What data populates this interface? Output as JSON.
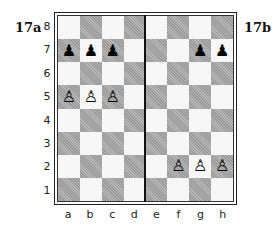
{
  "diagram": {
    "left_label": "17a",
    "right_label": "17b",
    "ranks": [
      "8",
      "7",
      "6",
      "5",
      "4",
      "3",
      "2",
      "1"
    ],
    "files": [
      "a",
      "b",
      "c",
      "d",
      "e",
      "f",
      "g",
      "h"
    ],
    "divider_between": [
      "d",
      "e"
    ],
    "pieces": {
      "a7": "♟",
      "b7": "♟",
      "c7": "♟",
      "g7": "♟",
      "h7": "♟",
      "a5": "♙",
      "b5": "♙",
      "c5": "♙",
      "f2": "♙",
      "g2": "♙",
      "h2": "♙"
    },
    "piece_names": {
      "a7": "black-pawn",
      "b7": "black-pawn",
      "c7": "black-pawn",
      "g7": "black-pawn",
      "h7": "black-pawn",
      "a5": "white-pawn",
      "b5": "white-pawn",
      "c5": "white-pawn",
      "f2": "white-pawn",
      "g2": "white-pawn",
      "h2": "white-pawn"
    }
  }
}
